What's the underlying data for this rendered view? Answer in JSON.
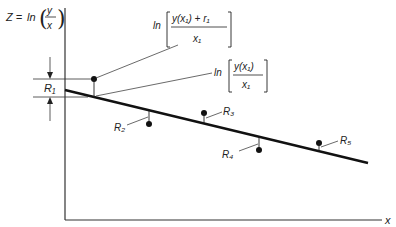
{
  "diagram": {
    "y_axis_label": "Z = ln(y/x)",
    "y_axis_label_parts": {
      "lhs": "Z = ",
      "fn": "ln",
      "num": "y",
      "den": "x"
    },
    "x_axis_label": "x",
    "annotations": {
      "upper": {
        "fn": "ln",
        "numerator": "y(x₁) + r₁",
        "denominator": "x₁"
      },
      "lower": {
        "fn": "ln",
        "numerator": "y(x₁)",
        "denominator": "x₁"
      }
    },
    "residual_labels": [
      "R₁",
      "R₂",
      "R₃",
      "R₄",
      "R₅"
    ],
    "colors": {
      "ink": "#222222",
      "background": "#ffffff"
    }
  }
}
